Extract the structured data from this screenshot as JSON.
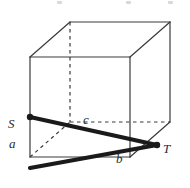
{
  "figure": {
    "background_color": "#ffffff",
    "line_color": "#3a3a3a",
    "thick_line_color": "#1a1a1a",
    "label_color": "#2b2b2b",
    "width": 190,
    "height": 188
  },
  "labels": {
    "S": "S",
    "a": "a",
    "b": "b",
    "c": "c",
    "T": "T"
  },
  "geometry": {
    "front_face": {
      "top_left": [
        30,
        57
      ],
      "top_right": [
        130,
        57
      ],
      "bottom_right": [
        130,
        157
      ],
      "bottom_left": [
        30,
        157
      ]
    },
    "back_face": {
      "top_left": [
        70,
        22
      ],
      "top_right": [
        170,
        22
      ],
      "bottom_right": [
        170,
        122
      ],
      "bottom_left": [
        70,
        122
      ]
    },
    "hidden_edges": [
      {
        "from": [
          70,
          22
        ],
        "to": [
          70,
          122
        ],
        "style": "dashed"
      },
      {
        "from": [
          70,
          122
        ],
        "to": [
          170,
          122
        ],
        "style": "dashed"
      },
      {
        "from": [
          30,
          157
        ],
        "to": [
          70,
          122
        ],
        "style": "dashed"
      }
    ],
    "points": {
      "S": [
        30,
        117
      ],
      "T": [
        157,
        145
      ],
      "corner": [
        30,
        168
      ]
    },
    "thick_paths": [
      {
        "name": "path-S-to-T",
        "from": [
          30,
          117
        ],
        "to": [
          157,
          145
        ]
      },
      {
        "name": "path-corner-to-T",
        "from": [
          30,
          168
        ],
        "to": [
          157,
          145
        ]
      }
    ]
  }
}
